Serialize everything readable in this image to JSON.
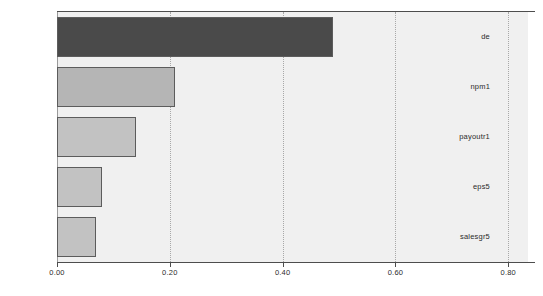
{
  "chart_data": {
    "type": "bar",
    "orientation": "horizontal",
    "title": "",
    "xlabel": "",
    "ylabel": "",
    "categories": [
      "de",
      "npm1",
      "payoutr1",
      "eps5",
      "salesgr5"
    ],
    "values": [
      0.49,
      0.21,
      0.14,
      0.08,
      0.07
    ],
    "xlim": [
      0.0,
      0.835
    ],
    "ylim": [
      0,
      5
    ],
    "xticks": [
      0.0,
      0.2,
      0.4,
      0.6,
      0.8
    ],
    "xtick_labels": [
      "0.00",
      "0.20",
      "0.40",
      "0.60",
      "0.80"
    ],
    "grid": "vertical-dotted",
    "legend": "none",
    "bar_colors": [
      "#4a4a4a",
      "#b5b5b5",
      "#c2c2c2",
      "#c2c2c2",
      "#c2c2c2"
    ],
    "bar_edge_color": "#5c5c5c",
    "plot_background": "#f0f0f0",
    "gridline_color": "#a8a8a8",
    "axis_color": "#4d4d4d",
    "series": [
      {
        "name": "importance",
        "points": [
          {
            "category": "de",
            "value": 0.49
          },
          {
            "category": "npm1",
            "value": 0.21
          },
          {
            "category": "payoutr1",
            "value": 0.14
          },
          {
            "category": "eps5",
            "value": 0.08
          },
          {
            "category": "salesgr5",
            "value": 0.07
          }
        ]
      }
    ]
  }
}
